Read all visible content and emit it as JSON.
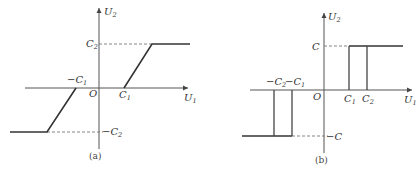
{
  "panels": [
    {
      "id": "a",
      "caption": "(a)",
      "axes": {
        "x_label": "U",
        "x_sub": "1",
        "y_label": "U",
        "y_sub": "2",
        "origin": "O"
      },
      "labels": {
        "pos_c2": {
          "main": "C",
          "sub": "2"
        },
        "neg_c2": {
          "main": "−C",
          "sub": "2"
        },
        "pos_c1": {
          "main": "C",
          "sub": "1"
        },
        "neg_c1": {
          "main": "−C",
          "sub": "1"
        }
      },
      "description": "Dead-zone with saturation characteristic"
    },
    {
      "id": "b",
      "caption": "(b)",
      "axes": {
        "x_label": "U",
        "x_sub": "1",
        "y_label": "U",
        "y_sub": "2",
        "origin": "O"
      },
      "labels": {
        "pos_c": {
          "main": "C"
        },
        "neg_c": {
          "main": "−C"
        },
        "pos_c1": {
          "main": "C",
          "sub": "1"
        },
        "pos_c2": {
          "main": "C",
          "sub": "2"
        },
        "neg_c1": {
          "main": "−C",
          "sub": "1"
        },
        "neg_c2": {
          "main": "−C",
          "sub": "2"
        }
      },
      "description": "Relay characteristic with dead zone and hysteresis"
    }
  ]
}
